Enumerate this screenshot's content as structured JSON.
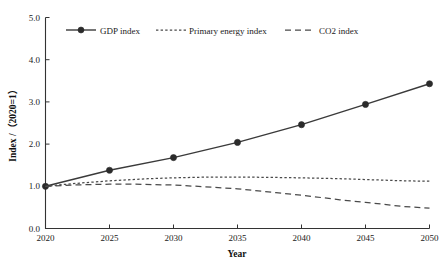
{
  "chart_data": {
    "type": "line",
    "title": "",
    "xlabel": "Year",
    "ylabel": "Index /（2020=1）",
    "x": [
      2020,
      2025,
      2030,
      2035,
      2040,
      2045,
      2050
    ],
    "xlim": [
      2020,
      2050
    ],
    "ylim": [
      0.0,
      5.0
    ],
    "xticks": [
      "2020",
      "2025",
      "2030",
      "2035",
      "2040",
      "2045",
      "2050"
    ],
    "yticks": [
      "0.0",
      "1.0",
      "2.0",
      "3.0",
      "4.0",
      "5.0"
    ],
    "grid": false,
    "legend_position": "top-inside",
    "series": [
      {
        "name": "GDP index",
        "style": "solid-with-markers",
        "marker": "circle",
        "values": [
          1.0,
          1.38,
          1.68,
          2.04,
          2.46,
          2.94,
          3.43
        ]
      },
      {
        "name": "Primary energy index",
        "style": "dotted",
        "marker": "none",
        "x": [
          2020,
          2022,
          2025,
          2028,
          2030,
          2033,
          2035,
          2038,
          2040,
          2043,
          2045,
          2048,
          2050
        ],
        "values": [
          1.0,
          1.06,
          1.13,
          1.18,
          1.2,
          1.22,
          1.22,
          1.21,
          1.2,
          1.18,
          1.16,
          1.13,
          1.12
        ]
      },
      {
        "name": "CO2 index",
        "style": "dashed",
        "marker": "none",
        "x": [
          2020,
          2022,
          2025,
          2027,
          2030,
          2033,
          2035,
          2038,
          2040,
          2043,
          2045,
          2048,
          2050
        ],
        "values": [
          1.0,
          1.03,
          1.05,
          1.05,
          1.03,
          0.98,
          0.94,
          0.85,
          0.79,
          0.68,
          0.62,
          0.52,
          0.48
        ]
      }
    ]
  },
  "legend": {
    "items": [
      {
        "label": "GDP index"
      },
      {
        "label": "Primary energy index"
      },
      {
        "label": "CO2 index"
      }
    ]
  },
  "axes": {
    "x_title": "Year",
    "y_title": "Index /（2020=1）"
  }
}
